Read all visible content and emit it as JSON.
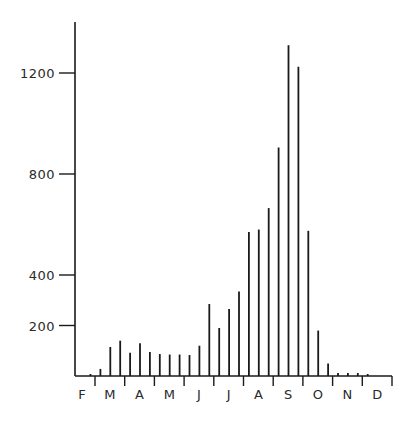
{
  "chart_data": {
    "type": "bar",
    "title": "",
    "xlabel": "",
    "ylabel": "",
    "ylim": [
      0,
      1400
    ],
    "grid": false,
    "legend": "none",
    "yticks": [
      200,
      400,
      800,
      1200
    ],
    "ytick_labels": [
      "200",
      "400",
      "800",
      "1200"
    ],
    "months": [
      "F",
      "M",
      "A",
      "M",
      "J",
      "J",
      "A",
      "S",
      "O",
      "N",
      "D"
    ],
    "bars_per_month_note": "approx. three bars per month (10-day intervals)",
    "values": [
      8,
      28,
      115,
      140,
      92,
      130,
      95,
      87,
      85,
      85,
      83,
      120,
      285,
      190,
      265,
      335,
      570,
      580,
      665,
      905,
      1310,
      1225,
      575,
      180,
      50,
      12,
      12,
      12,
      8
    ]
  }
}
